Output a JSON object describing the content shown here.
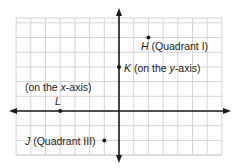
{
  "diagram": {
    "type": "coordinate-plane",
    "grid": {
      "x_min": -7,
      "x_max": 7,
      "y_min": -3,
      "y_max": 6,
      "cell_px": 14.7,
      "origin_px": [
        119,
        111
      ],
      "left_px": 16,
      "right_px": 222,
      "top_px": 18,
      "bottom_px": 155
    },
    "colors": {
      "grid": "#d4d4d4",
      "axis": "#1a1a1a",
      "point": "#1a1a1a",
      "text": "#1a1a1a"
    },
    "points": [
      {
        "name": "H",
        "x": 2,
        "y": 5,
        "note": "(Quadrant I)"
      },
      {
        "name": "K",
        "x": 0,
        "y": 3,
        "note": "(on the y-axis)"
      },
      {
        "name": "L",
        "x": -4,
        "y": 0,
        "note": "(on the x-axis)"
      },
      {
        "name": "J",
        "x": -1,
        "y": -2,
        "note": "(Quadrant III)"
      }
    ]
  },
  "labels": {
    "h_name": "H",
    "h_note": " (Quadrant I)",
    "k_name": "K",
    "k_note_a": " (on the ",
    "k_note_var": "y",
    "k_note_b": "-axis)",
    "l_note_a": "(on the ",
    "l_note_var": "x",
    "l_note_b": "-axis)",
    "l_name": "L",
    "j_name": "J",
    "j_note": " (Quadrant III)"
  }
}
